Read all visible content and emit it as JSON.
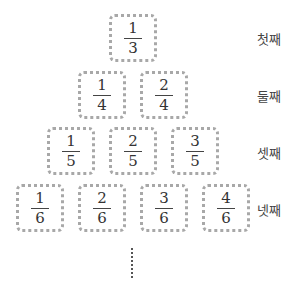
{
  "rows": [
    {
      "label": "첫째",
      "fractions": [
        {
          "num": "1",
          "den": "3"
        }
      ]
    },
    {
      "label": "둘째",
      "fractions": [
        {
          "num": "1",
          "den": "4"
        },
        {
          "num": "2",
          "den": "4"
        }
      ]
    },
    {
      "label": "셋째",
      "fractions": [
        {
          "num": "1",
          "den": "5"
        },
        {
          "num": "2",
          "den": "5"
        },
        {
          "num": "3",
          "den": "5"
        }
      ]
    },
    {
      "label": "넷째",
      "fractions": [
        {
          "num": "1",
          "den": "6"
        },
        {
          "num": "2",
          "den": "6"
        },
        {
          "num": "3",
          "den": "6"
        },
        {
          "num": "4",
          "den": "6"
        }
      ]
    }
  ],
  "continuation": "⋮",
  "colors": {
    "box_border": "#a8a8a8",
    "text": "#333333"
  }
}
